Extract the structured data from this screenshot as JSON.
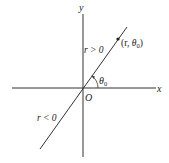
{
  "diagram": {
    "title": "",
    "axes": {
      "x_label": "x",
      "y_label": "y",
      "origin_label": "O"
    },
    "line": {
      "positive_side_label": "r > 0",
      "negative_side_label": "r < 0"
    },
    "point": {
      "label_open": "(r, ",
      "theta": "θ",
      "sub": "0",
      "label_close": ")"
    },
    "angle": {
      "theta": "θ",
      "sub": "0"
    },
    "colors": {
      "stroke": "#333333",
      "background": "#ffffff"
    }
  }
}
